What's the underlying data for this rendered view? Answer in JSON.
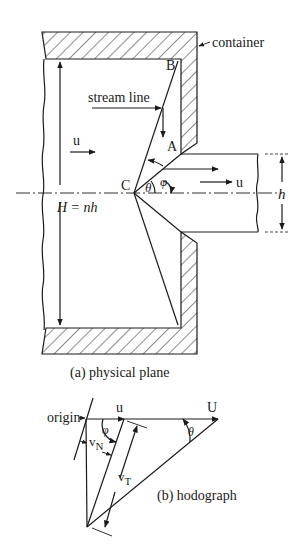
{
  "figure": {
    "physical_plane": {
      "caption": "(a) physical plane",
      "labels": {
        "container": "container",
        "stream_line": "stream line",
        "point_b": "B",
        "point_a": "A",
        "point_c": "C",
        "velocity_in": "u",
        "velocity_out": "u",
        "height_total": "H = nh",
        "height_exit": "h",
        "angle_theta": "θ",
        "angle_phi": "φ"
      }
    },
    "hodograph": {
      "caption": "(b) hodograph",
      "labels": {
        "origin": "origin",
        "u": "u",
        "U": "U",
        "phi": "φ",
        "theta": "θ",
        "v_n": "v",
        "v_n_sub": "N",
        "v_t": "v",
        "v_t_sub": "T"
      }
    },
    "colors": {
      "line": "#1a1a1a",
      "background": "#ffffff"
    }
  }
}
